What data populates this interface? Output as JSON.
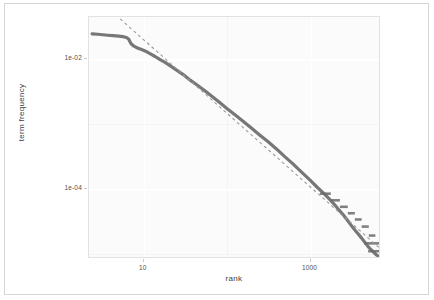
{
  "figure": {
    "border_color": "#d6d6d6",
    "panel_bg": "#fbfbfb",
    "grid_color": "#ffffff"
  },
  "chart_data": {
    "type": "line",
    "title": "",
    "subtitle": "",
    "xlabel": "rank",
    "ylabel": "term frequency",
    "xscale": "log10",
    "yscale": "log10",
    "grid": true,
    "legend_position": "none",
    "xlim": [
      2.2,
      7000
    ],
    "ylim": [
      8.5e-06,
      0.045
    ],
    "xticks": [
      10,
      1000
    ],
    "xtick_labels": [
      "10",
      "1000"
    ],
    "yticks": [
      0.01,
      0.0001
    ],
    "ytick_labels": [
      "1e-02",
      "1e-04"
    ],
    "minor_xticks": [
      100
    ],
    "minor_yticks": [
      0.001,
      1e-05
    ],
    "series": [
      {
        "name": "empirical term frequency",
        "style": "solid",
        "color": "#6b6b6b",
        "width": 3.2,
        "description": "Zipf curve: flat shoulder for top ranks, power-law decline, staircase plateaus in the tail",
        "points": [
          [
            2.4,
            0.0248
          ],
          [
            2.8,
            0.0244
          ],
          [
            3.2,
            0.024
          ],
          [
            3.7,
            0.0236
          ],
          [
            4.3,
            0.0232
          ],
          [
            5.0,
            0.0228
          ],
          [
            5.6,
            0.0224
          ],
          [
            6.2,
            0.0218
          ],
          [
            6.6,
            0.0205
          ],
          [
            7.0,
            0.0176
          ],
          [
            7.6,
            0.016
          ],
          [
            8.4,
            0.015
          ],
          [
            9.4,
            0.0142
          ],
          [
            10.5,
            0.0134
          ],
          [
            12.0,
            0.0122
          ],
          [
            13.5,
            0.0112
          ],
          [
            15.5,
            0.01
          ],
          [
            18.0,
            0.009
          ],
          [
            21.0,
            0.0079
          ],
          [
            25.0,
            0.0068
          ],
          [
            30.0,
            0.0058
          ],
          [
            36.0,
            0.0048
          ],
          [
            44.0,
            0.004
          ],
          [
            54.0,
            0.0033
          ],
          [
            66.0,
            0.0027
          ],
          [
            82.0,
            0.00215
          ],
          [
            100.0,
            0.00175
          ],
          [
            125.0,
            0.0014
          ],
          [
            155.0,
            0.00112
          ],
          [
            195.0,
            0.00088
          ],
          [
            245.0,
            0.00069
          ],
          [
            310.0,
            0.00054
          ],
          [
            390.0,
            0.00042
          ],
          [
            490.0,
            0.00032
          ],
          [
            620.0,
            0.000245
          ],
          [
            780.0,
            0.000185
          ],
          [
            980.0,
            0.00014
          ],
          [
            1200.0,
            0.000108
          ],
          [
            1450.0,
            8.6e-05
          ],
          [
            1700.0,
            7e-05
          ],
          [
            1950.0,
            5.8e-05
          ],
          [
            2200.0,
            4.8e-05
          ],
          [
            2450.0,
            4.1e-05
          ],
          [
            2700.0,
            3.5e-05
          ],
          [
            2950.0,
            3e-05
          ],
          [
            3200.0,
            2.62e-05
          ],
          [
            3500.0,
            2.28e-05
          ],
          [
            3800.0,
            2e-05
          ],
          [
            4100.0,
            1.78e-05
          ],
          [
            4400.0,
            1.58e-05
          ],
          [
            4700.0,
            1.42e-05
          ],
          [
            5000.0,
            1.28e-05
          ],
          [
            5400.0,
            1.16e-05
          ],
          [
            5800.0,
            1.06e-05
          ],
          [
            6200.0,
            9.8e-06
          ],
          [
            6600.0,
            9.2e-06
          ]
        ],
        "tail_steps": [
          [
            1300,
            1750,
            8.6e-05
          ],
          [
            1750,
            2250,
            6.8e-05
          ],
          [
            2250,
            2800,
            5.4e-05
          ],
          [
            2800,
            3400,
            4.3e-05
          ],
          [
            3400,
            4100,
            3.45e-05
          ],
          [
            4100,
            5000,
            2.68e-05
          ],
          [
            5000,
            6000,
            1.95e-05
          ],
          [
            4400,
            6800,
            1.48e-05
          ],
          [
            4900,
            6900,
            1.12e-05
          ]
        ]
      },
      {
        "name": "zipf reference slope",
        "style": "dashed",
        "color": "#9a9a9a",
        "width": 1.1,
        "description": "dashed straight reference line with slope ~ -1 on log-log axes",
        "endpoints": [
          [
            5.2,
            0.042
          ],
          [
            6600,
            1.28e-05
          ]
        ]
      }
    ]
  }
}
